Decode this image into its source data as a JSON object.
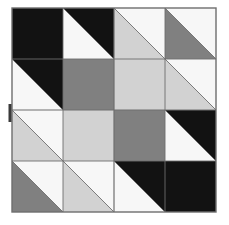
{
  "image": {
    "title": "Quilt Block Pattern",
    "kind": "quilt-block-diagram",
    "width": 229,
    "height": 225,
    "background_color": "#ffffff"
  },
  "palette": {
    "black": "#121212",
    "dark_grey": "#7d7d7d",
    "medium_grey": "#808080",
    "light_grey": "#d2d2d2",
    "white": "#f7f7f7",
    "outline": "#6e6e6e",
    "background": "#ffffff",
    "tick_color": "#3a3a3a"
  },
  "block": {
    "label": "Quilt block",
    "x": 12,
    "y": 8,
    "size": 204,
    "grid_rows": 4,
    "grid_cols": 4,
    "cell_size": 51,
    "outline_color": "#6e6e6e",
    "outline_width": 1.4
  },
  "marker": {
    "label": "edge tick mark",
    "x": 8.5,
    "y": 104,
    "width": 3,
    "height": 18,
    "color": "#3a3a3a"
  },
  "cells": [
    {
      "name": "r0c0",
      "row": 0,
      "col": 0,
      "type": "solid",
      "fill": "black",
      "diag": null
    },
    {
      "name": "r0c1",
      "row": 0,
      "col": 1,
      "type": "hst",
      "fill": "white",
      "back": "black",
      "diag": "tl-br",
      "first": "white"
    },
    {
      "name": "r0c2",
      "row": 0,
      "col": 2,
      "type": "hst",
      "fill": "light_grey",
      "back": "white",
      "diag": "tl-br",
      "first": "light_grey"
    },
    {
      "name": "r0c3",
      "row": 0,
      "col": 3,
      "type": "hst",
      "fill": "medium_grey",
      "back": "white",
      "diag": "tl-br",
      "first": "medium_grey"
    },
    {
      "name": "r1c0",
      "row": 1,
      "col": 0,
      "type": "hst",
      "fill": "white",
      "back": "black",
      "diag": "tl-br",
      "first": "white"
    },
    {
      "name": "r1c1",
      "row": 1,
      "col": 1,
      "type": "solid",
      "fill": "medium_grey",
      "diag": null
    },
    {
      "name": "r1c2",
      "row": 1,
      "col": 2,
      "type": "solid",
      "fill": "light_grey",
      "diag": null
    },
    {
      "name": "r1c3",
      "row": 1,
      "col": 3,
      "type": "hst",
      "fill": "light_grey",
      "back": "white",
      "diag": "tl-br",
      "first": "light_grey"
    },
    {
      "name": "r2c0",
      "row": 2,
      "col": 0,
      "type": "hst",
      "fill": "light_grey",
      "back": "white",
      "diag": "tl-br",
      "first": "light_grey"
    },
    {
      "name": "r2c1",
      "row": 2,
      "col": 1,
      "type": "solid",
      "fill": "light_grey",
      "diag": null
    },
    {
      "name": "r2c2",
      "row": 2,
      "col": 2,
      "type": "solid",
      "fill": "medium_grey",
      "diag": null
    },
    {
      "name": "r2c3",
      "row": 2,
      "col": 3,
      "type": "hst",
      "fill": "white",
      "back": "black",
      "diag": "tl-br",
      "first": "white"
    },
    {
      "name": "r3c0",
      "row": 3,
      "col": 0,
      "type": "hst",
      "fill": "medium_grey",
      "back": "white",
      "diag": "tl-br",
      "first": "medium_grey"
    },
    {
      "name": "r3c1",
      "row": 3,
      "col": 1,
      "type": "hst",
      "fill": "light_grey",
      "back": "white",
      "diag": "tl-br",
      "first": "light_grey"
    },
    {
      "name": "r3c2",
      "row": 3,
      "col": 2,
      "type": "hst",
      "fill": "white",
      "back": "black",
      "diag": "tl-br",
      "first": "white"
    },
    {
      "name": "r3c3",
      "row": 3,
      "col": 3,
      "type": "solid",
      "fill": "black",
      "diag": null
    }
  ],
  "grid_lines": {
    "internal_color": "#6e6e6e",
    "internal_width": 0.9,
    "quarter_color": "#6e6e6e",
    "quarter_width": 1.2
  }
}
